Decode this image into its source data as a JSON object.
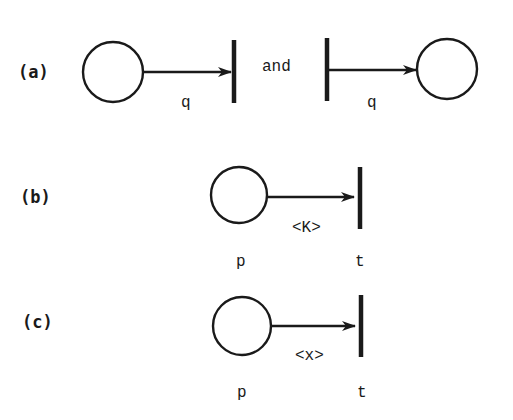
{
  "diagram": {
    "colors": {
      "ink": "#1a1a1a",
      "background": "#ffffff"
    },
    "panels": [
      {
        "id": "a",
        "label": "(a)",
        "parts": [
          {
            "type": "place-to-transition",
            "arc_label": "q"
          },
          {
            "type": "transition-to-place",
            "arc_label": "q"
          }
        ],
        "connector": "and"
      },
      {
        "id": "b",
        "label": "(b)",
        "place_name": "p",
        "transition_name": "t",
        "arc_label": "<K>"
      },
      {
        "id": "c",
        "label": "(c)",
        "place_name": "p",
        "transition_name": "t",
        "arc_label": "<x>"
      }
    ]
  }
}
